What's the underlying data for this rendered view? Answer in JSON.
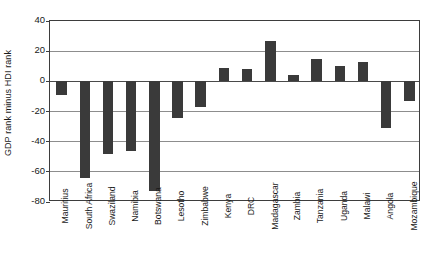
{
  "chart_data": {
    "type": "bar",
    "title": "",
    "subtitle": "",
    "xlabel": "",
    "ylabel": "GDP rank minus HDI rank",
    "ylim": [
      -80,
      40
    ],
    "ytick_labels": [
      "40",
      "20",
      "0",
      "-20",
      "-40",
      "-60",
      "-80"
    ],
    "yticks": [
      40,
      20,
      0,
      -20,
      -40,
      -60,
      -80
    ],
    "grid": true,
    "legend": false,
    "legend_position": "none",
    "bar_color": "#3a3a3a",
    "axis_color": "#3d3d3d",
    "gridline_color": "#8d8d8d",
    "categories": [
      "Mauritius",
      "South Africa",
      "Swaziland",
      "Namibia",
      "Botswana",
      "Lesotho",
      "Zimbabwe",
      "Kenya",
      "DRC",
      "Madagascar",
      "Zambia",
      "Tanzania",
      "Uganda",
      "Malawi",
      "Angola",
      "Mozambique"
    ],
    "values": [
      -9,
      -64,
      -48,
      -46,
      -73,
      -24,
      -17,
      9,
      8,
      27,
      4,
      15,
      10,
      13,
      -31,
      -13
    ]
  }
}
